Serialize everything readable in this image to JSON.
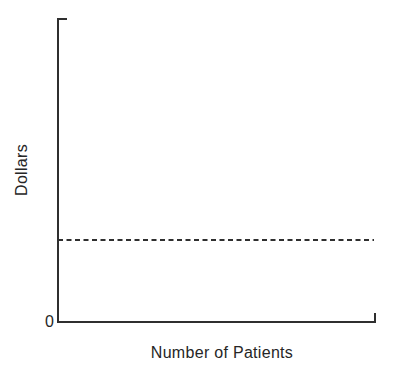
{
  "figure": {
    "ylabel": "Dollars",
    "xlabel": "Number of Patients",
    "origin_label": "0"
  },
  "chart_data": {
    "type": "line",
    "title": "",
    "xlabel": "Number of Patients",
    "ylabel": "Dollars",
    "x_axis": {
      "tick_labels": [],
      "numeric_scale_shown": false
    },
    "y_axis": {
      "tick_labels": [
        "0"
      ],
      "numeric_scale_shown": false
    },
    "series": [
      {
        "name": "constant-dollars-line",
        "style": "dashed",
        "shape": "horizontal constant line spanning full x-axis",
        "y_fraction_of_axis_height": 0.27
      }
    ],
    "legend": "none",
    "grid": false,
    "colors": {
      "line": "#2f2f2f",
      "text": "#262626",
      "background": "#ffffff"
    }
  }
}
